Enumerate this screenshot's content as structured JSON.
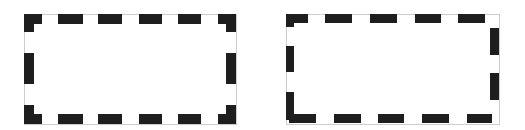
{
  "figure": {
    "colors": {
      "dash": "#1e1e1e",
      "outline": "#9a9a9a",
      "background": "#ffffff"
    },
    "shapes": [
      {
        "name": "dashed-rectangle-left",
        "outline": {
          "x": 24,
          "y": 14,
          "w": 212,
          "h": 110
        },
        "dashes": [
          {
            "x": 24,
            "y": 14,
            "w": 18,
            "h": 10
          },
          {
            "x": 24,
            "y": 14,
            "w": 10,
            "h": 18
          },
          {
            "x": 58,
            "y": 14,
            "w": 25,
            "h": 10
          },
          {
            "x": 98,
            "y": 14,
            "w": 24,
            "h": 10
          },
          {
            "x": 139,
            "y": 14,
            "w": 23,
            "h": 10
          },
          {
            "x": 178,
            "y": 14,
            "w": 23,
            "h": 10
          },
          {
            "x": 218,
            "y": 14,
            "w": 18,
            "h": 10
          },
          {
            "x": 226,
            "y": 14,
            "w": 10,
            "h": 18
          },
          {
            "x": 24,
            "y": 53,
            "w": 10,
            "h": 31
          },
          {
            "x": 226,
            "y": 53,
            "w": 10,
            "h": 31
          },
          {
            "x": 24,
            "y": 105,
            "w": 10,
            "h": 19
          },
          {
            "x": 24,
            "y": 114,
            "w": 18,
            "h": 10
          },
          {
            "x": 58,
            "y": 114,
            "w": 25,
            "h": 10
          },
          {
            "x": 98,
            "y": 114,
            "w": 24,
            "h": 10
          },
          {
            "x": 139,
            "y": 114,
            "w": 23,
            "h": 10
          },
          {
            "x": 178,
            "y": 114,
            "w": 23,
            "h": 10
          },
          {
            "x": 226,
            "y": 105,
            "w": 10,
            "h": 19
          },
          {
            "x": 218,
            "y": 114,
            "w": 18,
            "h": 10
          }
        ]
      },
      {
        "name": "dashed-rectangle-right",
        "outline": {
          "x": 286,
          "y": 14,
          "w": 213,
          "h": 110
        },
        "dashes": [
          {
            "x": 286,
            "y": 14,
            "w": 22,
            "h": 9
          },
          {
            "x": 286,
            "y": 14,
            "w": 8,
            "h": 13
          },
          {
            "x": 325,
            "y": 14,
            "w": 27,
            "h": 9
          },
          {
            "x": 370,
            "y": 14,
            "w": 27,
            "h": 9
          },
          {
            "x": 415,
            "y": 14,
            "w": 26,
            "h": 9
          },
          {
            "x": 458,
            "y": 14,
            "w": 27,
            "h": 9
          },
          {
            "x": 490,
            "y": 28,
            "w": 9,
            "h": 27
          },
          {
            "x": 490,
            "y": 73,
            "w": 9,
            "h": 27
          },
          {
            "x": 286,
            "y": 46,
            "w": 8,
            "h": 26
          },
          {
            "x": 286,
            "y": 92,
            "w": 8,
            "h": 28
          },
          {
            "x": 289,
            "y": 114,
            "w": 27,
            "h": 9
          },
          {
            "x": 334,
            "y": 114,
            "w": 27,
            "h": 9
          },
          {
            "x": 378,
            "y": 114,
            "w": 26,
            "h": 9
          },
          {
            "x": 422,
            "y": 114,
            "w": 27,
            "h": 9
          },
          {
            "x": 467,
            "y": 114,
            "w": 25,
            "h": 9
          }
        ]
      }
    ]
  }
}
